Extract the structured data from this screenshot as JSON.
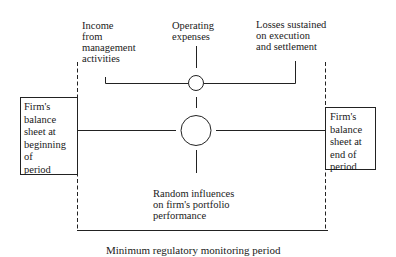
{
  "diagram": {
    "inputs": {
      "income": "Income\nfrom\nmanagement\nactivities",
      "operating_expenses": "Operating\nexpenses",
      "losses": "Losses sustained\non execution\nand settlement",
      "random_influences": "Random influences\non firm's portfolio\nperformance"
    },
    "balance_sheet_start": "Firm's\nbalance\nsheet at\nbeginning\nof\nperiod",
    "balance_sheet_end": "Firm's\nbalance\nsheet at\nend of\nperiod",
    "period_caption": "Minimum regulatory monitoring period",
    "nodes": [
      {
        "id": "small-junction",
        "shape": "circle",
        "size": "small"
      },
      {
        "id": "large-junction",
        "shape": "circle",
        "size": "large"
      }
    ],
    "colors": {
      "line": "#222222",
      "background": "#ffffff"
    }
  }
}
